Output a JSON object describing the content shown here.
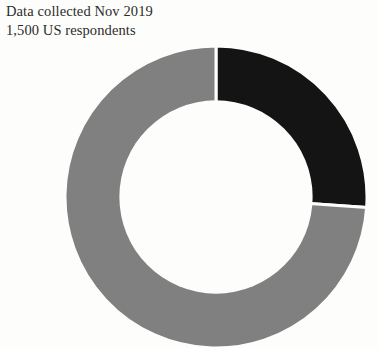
{
  "caption": {
    "line1": "Data collected Nov 2019",
    "line2": "1,500 US respondents"
  },
  "colors": {
    "background": "#fdfdfb",
    "text": "#2b2b2b",
    "slice_dark": "#141414",
    "slice_gray": "#808080",
    "gap": "#fdfdfb"
  },
  "chart_data": {
    "type": "pie",
    "variant": "donut",
    "title": "",
    "subtitle": "",
    "xlabel": "",
    "ylabel": "",
    "legend": "none",
    "grid": false,
    "start_angle_deg": 0,
    "direction": "clockwise",
    "inner_radius_ratio": 0.64,
    "categories": [
      "Segment 1",
      "Segment 2"
    ],
    "values": [
      26,
      74
    ],
    "slices": [
      {
        "name": "Segment 1",
        "value": 26,
        "color": "#141414",
        "start_angle_deg": 0,
        "end_angle_deg": 94
      },
      {
        "name": "Segment 2",
        "value": 74,
        "color": "#808080",
        "start_angle_deg": 94,
        "end_angle_deg": 360
      }
    ]
  }
}
